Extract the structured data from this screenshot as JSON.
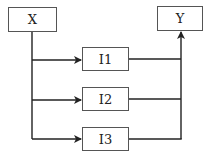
{
  "diagram": {
    "nodes": [
      {
        "id": "X",
        "label": "X"
      },
      {
        "id": "Y",
        "label": "Y"
      },
      {
        "id": "I1",
        "label": "I1"
      },
      {
        "id": "I2",
        "label": "I2"
      },
      {
        "id": "I3",
        "label": "I3"
      }
    ],
    "edges": [
      {
        "from": "X",
        "to": "I1"
      },
      {
        "from": "X",
        "to": "I2"
      },
      {
        "from": "X",
        "to": "I3"
      },
      {
        "from": "I1",
        "to": "Y"
      },
      {
        "from": "I2",
        "to": "Y"
      },
      {
        "from": "I3",
        "to": "Y"
      }
    ],
    "colors": {
      "line": "#222222",
      "border": "#555555",
      "background": "#ffffff"
    }
  }
}
